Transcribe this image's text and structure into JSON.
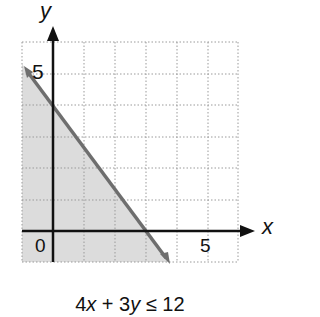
{
  "graph": {
    "x_axis_label": "x",
    "y_axis_label": "y",
    "origin_label": "0",
    "x_tick_label": "5",
    "y_tick_label": "5",
    "inequality_parts": {
      "a": "4",
      "x": "x",
      "plus": " + ",
      "b": "3",
      "y": "y",
      "rel": " ≤ ",
      "c": "12"
    },
    "inequality": "4x + 3y ≤ 12",
    "colors": {
      "shade": "#d9d9d9",
      "boundary": "#6e6e6e",
      "axis": "#111111",
      "grid": "#9a9a9a"
    },
    "x_range": [
      -1,
      6
    ],
    "y_range": [
      -1,
      6
    ],
    "boundary_intercepts": {
      "x": 3,
      "y": 4
    }
  }
}
